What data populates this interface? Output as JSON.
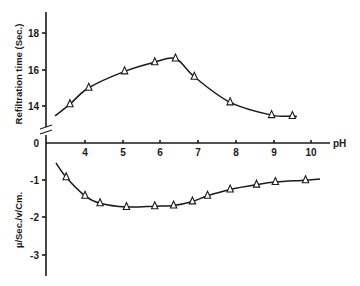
{
  "chart_data": [
    {
      "type": "line",
      "panel": "upper",
      "title": "",
      "xlabel": "pH",
      "ylabel": "Refiltration time (Sec.)",
      "x_ticks": [
        4,
        5,
        6,
        7,
        8,
        9,
        10
      ],
      "y_ticks": [
        14,
        16,
        18
      ],
      "y_axis_zero_label": "0",
      "y_axis_break": true,
      "xlim": [
        3,
        10.5
      ],
      "ylim": [
        13,
        19
      ],
      "grid": false,
      "marker": "open-triangle",
      "series": [
        {
          "name": "Refiltration time",
          "x": [
            3.6,
            4.1,
            5.05,
            5.85,
            6.4,
            6.9,
            7.85,
            8.95,
            9.5
          ],
          "y": [
            14.1,
            15.0,
            15.9,
            16.4,
            16.6,
            15.6,
            14.2,
            13.5,
            13.45
          ]
        }
      ]
    },
    {
      "type": "line",
      "panel": "lower",
      "title": "",
      "xlabel": "pH",
      "ylabel": "µ/Sec./v/Cm.",
      "x_ticks": [
        4,
        5,
        6,
        7,
        8,
        9,
        10
      ],
      "y_ticks": [
        0,
        -1,
        -2,
        -3
      ],
      "xlim": [
        3,
        10.5
      ],
      "ylim": [
        -3.5,
        0
      ],
      "grid": false,
      "marker": "open-triangle",
      "series": [
        {
          "name": "Electrophoretic mobility",
          "x": [
            3.5,
            4.0,
            4.4,
            5.1,
            5.85,
            6.35,
            6.85,
            7.25,
            7.85,
            8.55,
            9.05,
            9.85
          ],
          "y": [
            -0.92,
            -1.42,
            -1.62,
            -1.72,
            -1.7,
            -1.68,
            -1.57,
            -1.42,
            -1.25,
            -1.12,
            -1.05,
            -1.0
          ]
        }
      ]
    }
  ],
  "labels": {
    "upper_ylabel": "Refiltration time (Sec.)",
    "lower_ylabel": "µ/Sec./v/Cm.",
    "xlabel": "pH",
    "upper_ticks": [
      "18",
      "16",
      "14"
    ],
    "zero": "0",
    "lower_ticks": [
      "-1",
      "-2",
      "-3"
    ],
    "x_ticks": [
      "4",
      "5",
      "6",
      "7",
      "8",
      "9",
      "10"
    ]
  }
}
